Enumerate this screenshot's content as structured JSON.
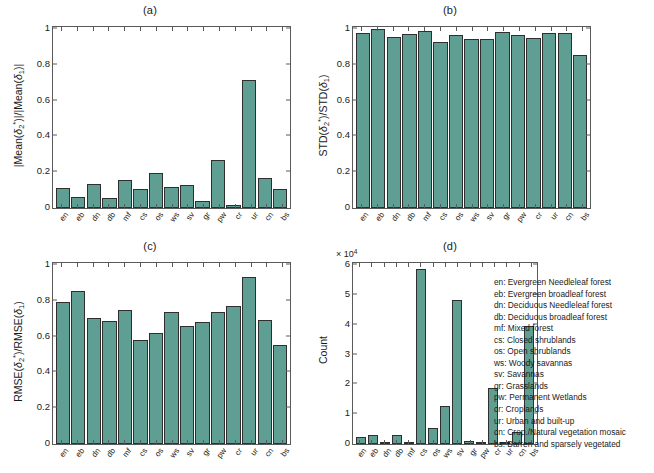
{
  "figure": {
    "background": "#ffffff",
    "bar_color": "#5f9e92",
    "bar_edge_color": "#2f2f2f"
  },
  "categories": [
    "en",
    "eb",
    "dn",
    "db",
    "mf",
    "cs",
    "os",
    "ws",
    "sv",
    "gr",
    "pw",
    "cr",
    "ur",
    "cn",
    "bs"
  ],
  "legend": {
    "name": "landcover-class-legend",
    "entries": [
      "en: Evergreen Needleleaf forest",
      "eb: Evergreen broadleaf forest",
      "dn: Deciduous Needleleaf forest",
      "db: Deciduous broadleaf forest",
      "mf: Mixed forest",
      "cs: Closed shrublands",
      "os: Open shrublands",
      "ws: Woody savannas",
      "sv: Savannas",
      "gr: Grasslands",
      "pw: Permanent Wetlands",
      "cr: Croplands",
      "ur: Urban and built-up",
      "cn: Crop./Natural vegetation mosaic",
      "bs: Barren and sparsely vegetated"
    ]
  },
  "chart_data": [
    {
      "type": "bar",
      "panel": "a",
      "title": "(a)",
      "xlabel": "",
      "ylabel": "|Mean(δ₂*)|/|Mean(δ₁)|",
      "ylim": [
        0,
        1
      ],
      "yticks": [
        0,
        0.2,
        0.4,
        0.6,
        0.8,
        1
      ],
      "ytick_labels": [
        "0",
        "0.2",
        "0.4",
        "0.6",
        "0.8",
        "1"
      ],
      "grid": false,
      "categories": [
        "en",
        "eb",
        "dn",
        "db",
        "mf",
        "cs",
        "os",
        "ws",
        "sv",
        "gr",
        "pw",
        "cr",
        "ur",
        "cn",
        "bs"
      ],
      "values": [
        0.11,
        0.06,
        0.135,
        0.055,
        0.155,
        0.105,
        0.195,
        0.12,
        0.13,
        0.04,
        0.27,
        0.015,
        0.715,
        0.17,
        0.105
      ]
    },
    {
      "type": "bar",
      "panel": "b",
      "title": "(b)",
      "xlabel": "",
      "ylabel": "STD(δ₂*)/STD(δ₁)",
      "ylim": [
        0,
        1
      ],
      "yticks": [
        0,
        0.2,
        0.4,
        0.6,
        0.8,
        1
      ],
      "ytick_labels": [
        "0",
        "0.2",
        "0.4",
        "0.6",
        "0.8",
        "1"
      ],
      "grid": false,
      "categories": [
        "en",
        "eb",
        "dn",
        "db",
        "mf",
        "cs",
        "os",
        "ws",
        "sv",
        "gr",
        "pw",
        "cr",
        "ur",
        "cn",
        "bs"
      ],
      "values": [
        0.975,
        1.0,
        0.955,
        0.97,
        0.99,
        0.925,
        0.965,
        0.945,
        0.945,
        0.985,
        0.965,
        0.95,
        0.975,
        0.975,
        0.855
      ]
    },
    {
      "type": "bar",
      "panel": "c",
      "title": "(c)",
      "xlabel": "",
      "ylabel": "RMSE(δ₂*)/RMSE(δ₁)",
      "ylim": [
        0,
        1
      ],
      "yticks": [
        0,
        0.2,
        0.4,
        0.6,
        0.8,
        1
      ],
      "ytick_labels": [
        "0",
        "0.2",
        "0.4",
        "0.6",
        "0.8",
        "1"
      ],
      "grid": false,
      "categories": [
        "en",
        "eb",
        "dn",
        "db",
        "mf",
        "cs",
        "os",
        "ws",
        "sv",
        "gr",
        "pw",
        "cr",
        "ur",
        "cn",
        "bs"
      ],
      "values": [
        0.795,
        0.855,
        0.705,
        0.69,
        0.75,
        0.58,
        0.62,
        0.735,
        0.66,
        0.68,
        0.735,
        0.77,
        0.935,
        0.695,
        0.555
      ]
    },
    {
      "type": "bar",
      "panel": "d",
      "title": "(d)",
      "xlabel": "",
      "ylabel": "Count",
      "y_exponent": "× 10",
      "y_exponent_power": "4",
      "ylim": [
        0,
        60000
      ],
      "yticks": [
        0,
        10000,
        20000,
        30000,
        40000,
        50000,
        60000
      ],
      "ytick_labels": [
        "0",
        "1",
        "2",
        "3",
        "4",
        "5",
        "6"
      ],
      "grid": false,
      "categories": [
        "en",
        "eb",
        "dn",
        "db",
        "mf",
        "cs",
        "os",
        "ws",
        "sv",
        "gr",
        "pw",
        "cr",
        "ur",
        "cn",
        "bs"
      ],
      "values": [
        2200,
        3100,
        700,
        2900,
        400,
        58800,
        5400,
        12700,
        48200,
        900,
        600,
        18700,
        300,
        4100,
        39500
      ]
    }
  ]
}
